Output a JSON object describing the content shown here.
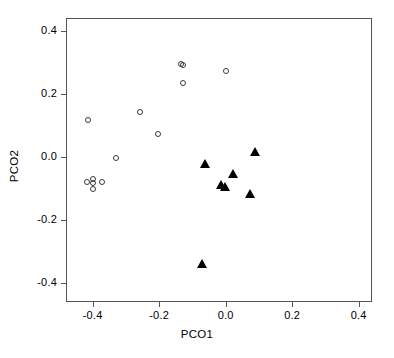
{
  "chart_data": {
    "type": "scatter",
    "title": "",
    "xlabel": "PCO1",
    "ylabel": "PCO2",
    "xlim": [
      -0.48,
      0.44
    ],
    "ylim": [
      -0.46,
      0.44
    ],
    "xticks": [
      -0.4,
      -0.2,
      0.0,
      0.2,
      0.4
    ],
    "xticklabels": [
      "-0.4",
      "-0.2",
      "0.0",
      "0.2",
      "0.4"
    ],
    "yticks": [
      -0.4,
      -0.2,
      0.0,
      0.2,
      0.4
    ],
    "yticklabels": [
      "-0.4",
      "-0.2",
      "0.0",
      "0.2",
      "0.4"
    ],
    "grid": false,
    "legend": "none",
    "series": [
      {
        "name": "group-open-circle",
        "marker": "open-circle",
        "color": "#3a3a3a",
        "points": [
          {
            "x": -0.418,
            "y": 0.121
          },
          {
            "x": -0.42,
            "y": -0.075
          },
          {
            "x": -0.403,
            "y": -0.068
          },
          {
            "x": -0.403,
            "y": -0.08
          },
          {
            "x": -0.376,
            "y": -0.076
          },
          {
            "x": -0.403,
            "y": -0.1
          },
          {
            "x": -0.334,
            "y": 0.0
          },
          {
            "x": -0.26,
            "y": 0.145
          },
          {
            "x": -0.206,
            "y": 0.074
          },
          {
            "x": -0.137,
            "y": 0.296
          },
          {
            "x": -0.131,
            "y": 0.293
          },
          {
            "x": -0.131,
            "y": 0.237
          },
          {
            "x": -0.003,
            "y": 0.276
          }
        ]
      },
      {
        "name": "group-filled-triangle",
        "marker": "filled-triangle",
        "color": "#000000",
        "points": [
          {
            "x": 0.084,
            "y": 0.021
          },
          {
            "x": -0.066,
            "y": -0.018
          },
          {
            "x": 0.018,
            "y": -0.05
          },
          {
            "x": -0.018,
            "y": -0.083
          },
          {
            "x": -0.006,
            "y": -0.092
          },
          {
            "x": 0.069,
            "y": -0.113
          },
          {
            "x": -0.075,
            "y": -0.335
          }
        ]
      }
    ]
  }
}
